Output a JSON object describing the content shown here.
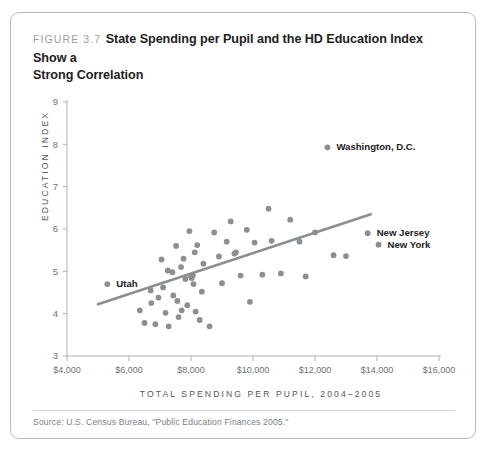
{
  "figure": {
    "number_label": "FIGURE 3.7",
    "title_line1": "State Spending per Pupil and the HD Education Index Show a",
    "title_line2": "Strong Correlation",
    "source_note": "Source: U.S. Census Bureau, \"Public Education Finances 2005.\"",
    "accent_color": "#8b8f92",
    "axis_color": "#aeb1b4",
    "text_color": "#1d2023"
  },
  "chart_data": {
    "type": "scatter",
    "title": "State Spending per Pupil and the HD Education Index Show a Strong Correlation",
    "xlabel": "TOTAL SPENDING PER PUPIL, 2004–2005",
    "ylabel": "EDUCATION INDEX",
    "xlim": [
      4000,
      16000
    ],
    "ylim": [
      3,
      9
    ],
    "xticks": [
      4000,
      6000,
      8000,
      10000,
      12000,
      14000,
      16000
    ],
    "xtick_labels": [
      "$4,000",
      "$6,000",
      "$8,000",
      "$10,000",
      "$12,000",
      "$14,000",
      "$16,000"
    ],
    "yticks": [
      3,
      4,
      5,
      6,
      7,
      8,
      9
    ],
    "ytick_labels": [
      "3",
      "4",
      "5",
      "6",
      "7",
      "8",
      "9"
    ],
    "grid": false,
    "legend": null,
    "trendline": {
      "x0": 5000,
      "y0": 4.22,
      "x1": 13800,
      "y1": 6.35
    },
    "points": [
      {
        "x": 5300,
        "y": 4.7,
        "label": "Utah",
        "label_dx": 9,
        "label_dy": 3.2
      },
      {
        "x": 12400,
        "y": 7.93,
        "label": "Washington, D.C.",
        "label_dx": 9,
        "label_dy": 3.2
      },
      {
        "x": 13700,
        "y": 5.9,
        "label": "New Jersey",
        "label_dx": 9,
        "label_dy": 3.2
      },
      {
        "x": 14050,
        "y": 5.63,
        "label": "New York",
        "label_dx": 9,
        "label_dy": 3.2
      },
      {
        "x": 6350,
        "y": 4.08,
        "label": null
      },
      {
        "x": 6500,
        "y": 3.78,
        "label": null
      },
      {
        "x": 6700,
        "y": 4.55,
        "label": null
      },
      {
        "x": 6720,
        "y": 4.25,
        "label": null
      },
      {
        "x": 6850,
        "y": 3.75,
        "label": null
      },
      {
        "x": 6950,
        "y": 4.38,
        "label": null
      },
      {
        "x": 7050,
        "y": 5.28,
        "label": null
      },
      {
        "x": 7100,
        "y": 4.62,
        "label": null
      },
      {
        "x": 7180,
        "y": 4.02,
        "label": null
      },
      {
        "x": 7250,
        "y": 5.02,
        "label": null
      },
      {
        "x": 7280,
        "y": 3.7,
        "label": null
      },
      {
        "x": 7400,
        "y": 4.98,
        "label": null
      },
      {
        "x": 7430,
        "y": 4.43,
        "label": null
      },
      {
        "x": 7520,
        "y": 5.6,
        "label": null
      },
      {
        "x": 7560,
        "y": 4.3,
        "label": null
      },
      {
        "x": 7600,
        "y": 3.92,
        "label": null
      },
      {
        "x": 7680,
        "y": 5.1,
        "label": null
      },
      {
        "x": 7700,
        "y": 4.08,
        "label": null
      },
      {
        "x": 7760,
        "y": 5.3,
        "label": null
      },
      {
        "x": 7820,
        "y": 4.82,
        "label": null
      },
      {
        "x": 7880,
        "y": 4.2,
        "label": null
      },
      {
        "x": 7950,
        "y": 5.95,
        "label": null
      },
      {
        "x": 8000,
        "y": 4.88,
        "label": null
      },
      {
        "x": 8020,
        "y": 4.84,
        "label": null
      },
      {
        "x": 8060,
        "y": 4.9,
        "label": null
      },
      {
        "x": 8080,
        "y": 4.7,
        "label": null
      },
      {
        "x": 8120,
        "y": 5.45,
        "label": null
      },
      {
        "x": 8150,
        "y": 4.05,
        "label": null
      },
      {
        "x": 8200,
        "y": 5.62,
        "label": null
      },
      {
        "x": 8280,
        "y": 3.85,
        "label": null
      },
      {
        "x": 8350,
        "y": 4.52,
        "label": null
      },
      {
        "x": 8400,
        "y": 5.18,
        "label": null
      },
      {
        "x": 8600,
        "y": 3.7,
        "label": null
      },
      {
        "x": 8750,
        "y": 5.92,
        "label": null
      },
      {
        "x": 8900,
        "y": 5.35,
        "label": null
      },
      {
        "x": 9000,
        "y": 4.72,
        "label": null
      },
      {
        "x": 9150,
        "y": 5.7,
        "label": null
      },
      {
        "x": 9280,
        "y": 6.18,
        "label": null
      },
      {
        "x": 9400,
        "y": 5.42,
        "label": null
      },
      {
        "x": 9450,
        "y": 5.45,
        "label": null
      },
      {
        "x": 9600,
        "y": 4.9,
        "label": null
      },
      {
        "x": 9800,
        "y": 5.98,
        "label": null
      },
      {
        "x": 9900,
        "y": 4.28,
        "label": null
      },
      {
        "x": 10050,
        "y": 5.68,
        "label": null
      },
      {
        "x": 10300,
        "y": 4.92,
        "label": null
      },
      {
        "x": 10500,
        "y": 6.48,
        "label": null
      },
      {
        "x": 10600,
        "y": 5.72,
        "label": null
      },
      {
        "x": 10900,
        "y": 4.95,
        "label": null
      },
      {
        "x": 11200,
        "y": 6.22,
        "label": null
      },
      {
        "x": 11500,
        "y": 5.7,
        "label": null
      },
      {
        "x": 11700,
        "y": 4.88,
        "label": null
      },
      {
        "x": 12000,
        "y": 5.92,
        "label": null
      },
      {
        "x": 12600,
        "y": 5.38,
        "label": null
      },
      {
        "x": 13000,
        "y": 5.36,
        "label": null
      }
    ]
  }
}
